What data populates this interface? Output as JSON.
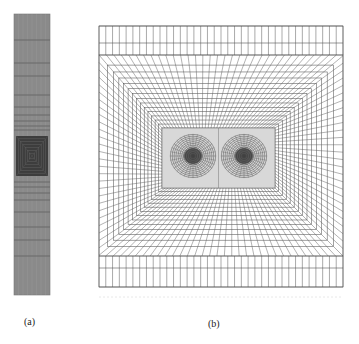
{
  "figure": {
    "panels": [
      {
        "id": "a",
        "label": "(a)",
        "description": "Tall narrow column mesh, dense refinement around a central square region",
        "bbox": [
          14,
          14,
          50,
          295
        ],
        "fill": "#8a8a8a",
        "dense_region": [
          16,
          136,
          48,
          176
        ],
        "row_lines_y": [
          40,
          63,
          76,
          95,
          107,
          115,
          121,
          126,
          130,
          182,
          187,
          193,
          200,
          212,
          227,
          240,
          256
        ],
        "col_count": 8
      },
      {
        "id": "b",
        "label": "(b)",
        "description": "Square mesh with nested rectangular rings converging on two vortex centers",
        "bbox": [
          99,
          26,
          343,
          287
        ],
        "top_rows_y": [
          26,
          43,
          55
        ],
        "bottom_rows_y": [
          256,
          268,
          287
        ],
        "columns": 36,
        "rings": 14,
        "inner_rect": [
          162,
          128,
          275,
          188
        ],
        "vortex_centers": [
          [
            193,
            156
          ],
          [
            244,
            156
          ]
        ],
        "line_color": "#555555"
      }
    ]
  },
  "labels": {
    "a": "(a)",
    "b": "(b)"
  }
}
